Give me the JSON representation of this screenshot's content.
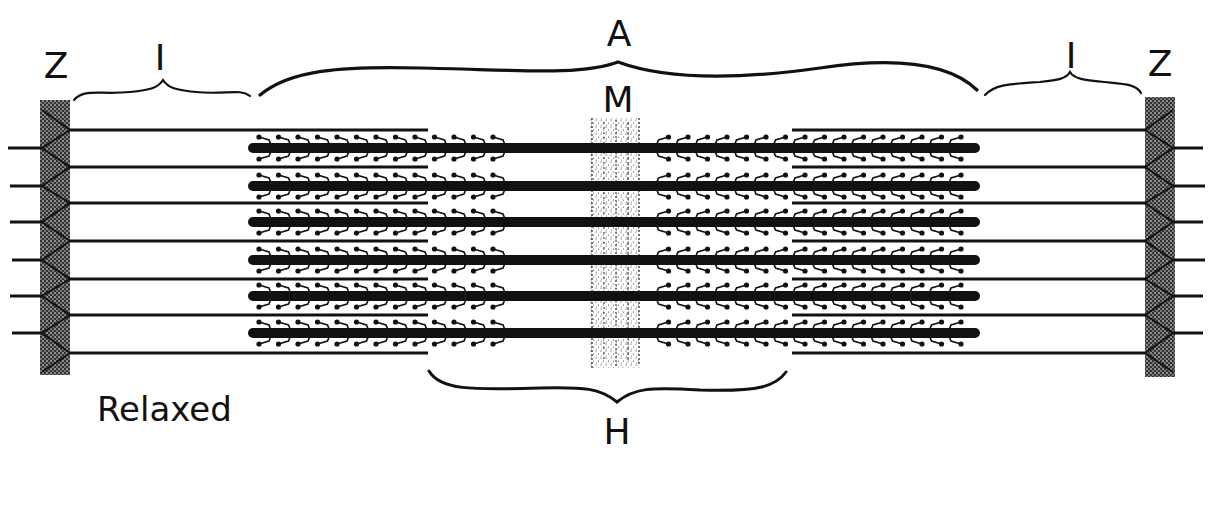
{
  "diagram": {
    "state_label": "Relaxed",
    "labels": {
      "z_left": "Z",
      "i_left": "I",
      "a_band": "A",
      "m_line": "M",
      "i_right": "I",
      "z_right": "Z",
      "h_zone": "H"
    },
    "colors": {
      "ink": "#111111",
      "background": "#ffffff",
      "stipple": "#555555"
    },
    "geometry": {
      "z_left_x": [
        40,
        70
      ],
      "z_right_x": [
        1145,
        1175
      ],
      "z_y": [
        100,
        375
      ],
      "thin_filament_y": [
        130,
        167,
        203,
        241,
        279,
        315,
        353
      ],
      "thin_left_x": [
        70,
        428
      ],
      "thin_right_x": [
        792,
        1145
      ],
      "thick_filament_y": [
        148,
        186,
        222,
        260,
        296,
        333
      ],
      "thick_x": [
        253,
        975
      ],
      "m_band_x": [
        590,
        640
      ],
      "h_zone_x": [
        428,
        785
      ],
      "a_band_x": [
        258,
        978
      ],
      "i_left_x": [
        72,
        250
      ],
      "i_right_x": [
        985,
        1140
      ]
    }
  }
}
